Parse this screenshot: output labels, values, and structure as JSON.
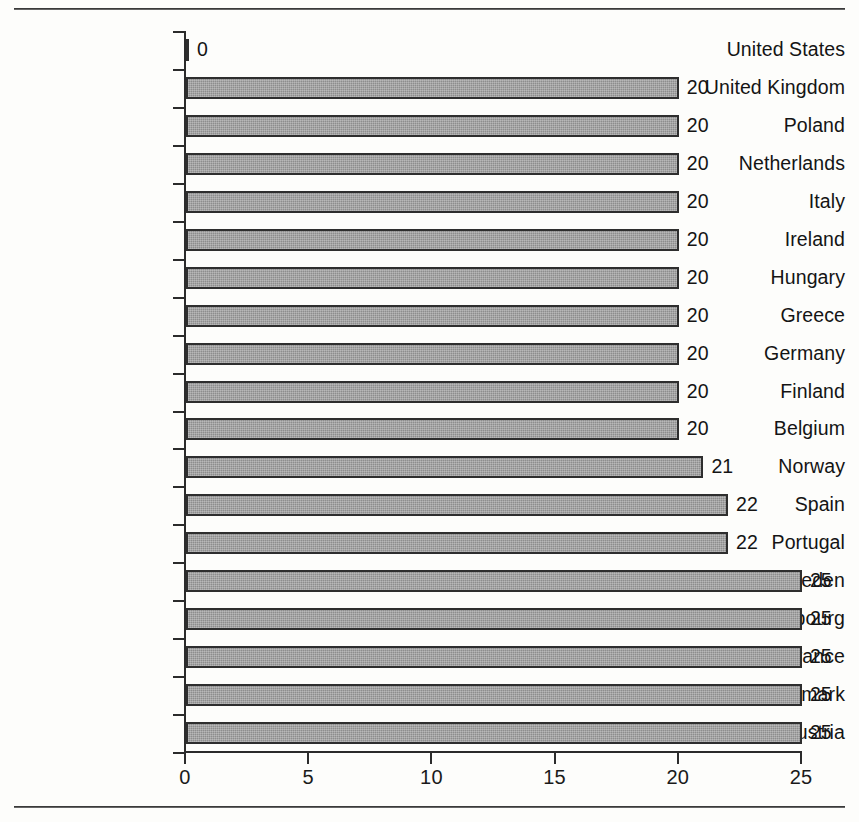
{
  "chart_data": {
    "type": "bar",
    "orientation": "horizontal",
    "title": "",
    "subtitle": "",
    "xlabel": "",
    "ylabel": "",
    "xlim": [
      0,
      25
    ],
    "xticks": [
      0,
      5,
      10,
      15,
      20,
      25
    ],
    "xtick_labels": [
      "0",
      "5",
      "10",
      "15",
      "20",
      "25"
    ],
    "grid": false,
    "legend": null,
    "categories": [
      "United States",
      "United Kingdom",
      "Poland",
      "Netherlands",
      "Italy",
      "Ireland",
      "Hungary",
      "Greece",
      "Germany",
      "Finland",
      "Belgium",
      "Norway",
      "Spain",
      "Portugal",
      "Sweden",
      "Luxembourg",
      "France",
      "Denmark",
      "Austria"
    ],
    "values": [
      0,
      20,
      20,
      20,
      20,
      20,
      20,
      20,
      20,
      20,
      20,
      21,
      22,
      22,
      25,
      25,
      25,
      25,
      25
    ],
    "data_labels": [
      "0",
      "20",
      "20",
      "20",
      "20",
      "20",
      "20",
      "20",
      "20",
      "20",
      "20",
      "21",
      "22",
      "22",
      "25",
      "25",
      "25",
      "25",
      "25"
    ],
    "series": [
      {
        "name": "",
        "values": [
          0,
          20,
          20,
          20,
          20,
          20,
          20,
          20,
          20,
          20,
          20,
          21,
          22,
          22,
          25,
          25,
          25,
          25,
          25
        ]
      }
    ]
  },
  "style": {
    "bar_fill": "#8d8d8d",
    "bar_border": "#2e2e2e",
    "axis_color": "#2b2b2b",
    "text_color": "#141414",
    "background": "#fdfdfb"
  }
}
